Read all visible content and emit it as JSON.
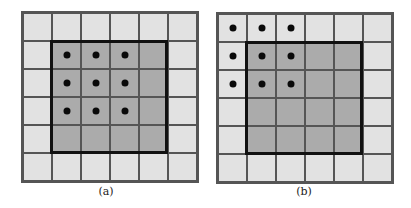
{
  "figure": {
    "grid_size": 6,
    "inner_region": {
      "row_start": 1,
      "row_end": 4,
      "col_start": 1,
      "col_end": 4
    },
    "colors": {
      "outer_cell": "#e2e2e2",
      "inner_cell": "#ababab",
      "thin_line": "#555555",
      "thick_border": "#111111",
      "dot": "#0a0a0a"
    },
    "panels": [
      {
        "label": "(a)",
        "dots": [
          [
            1,
            1
          ],
          [
            1,
            2
          ],
          [
            1,
            3
          ],
          [
            2,
            1
          ],
          [
            2,
            2
          ],
          [
            2,
            3
          ],
          [
            3,
            1
          ],
          [
            3,
            2
          ],
          [
            3,
            3
          ]
        ]
      },
      {
        "label": "(b)",
        "dots": [
          [
            0,
            0
          ],
          [
            0,
            1
          ],
          [
            0,
            2
          ],
          [
            1,
            0
          ],
          [
            1,
            1
          ],
          [
            1,
            2
          ],
          [
            2,
            0
          ],
          [
            2,
            1
          ],
          [
            2,
            2
          ]
        ]
      }
    ]
  }
}
